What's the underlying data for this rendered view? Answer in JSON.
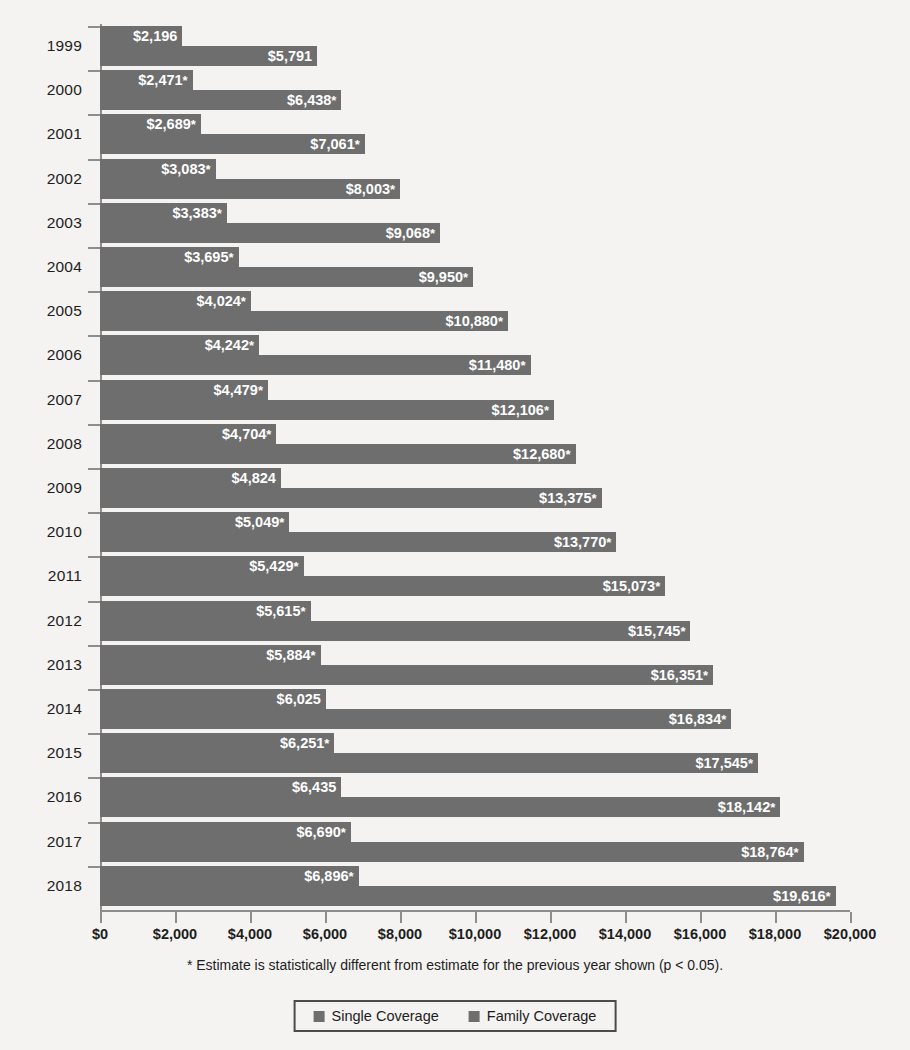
{
  "chart_data": {
    "type": "bar",
    "orientation": "horizontal",
    "title": "",
    "subtitle": "",
    "xlabel": "",
    "ylabel": "",
    "xlim": [
      0,
      20000
    ],
    "ylim": null,
    "grid": false,
    "legend_position": "bottom-center",
    "categories": [
      "1999",
      "2000",
      "2001",
      "2002",
      "2003",
      "2004",
      "2005",
      "2006",
      "2007",
      "2008",
      "2009",
      "2010",
      "2011",
      "2012",
      "2013",
      "2014",
      "2015",
      "2016",
      "2017",
      "2018"
    ],
    "x_ticks": [
      0,
      2000,
      4000,
      6000,
      8000,
      10000,
      12000,
      14000,
      16000,
      18000,
      20000
    ],
    "x_tick_labels": [
      "$0",
      "$2,000",
      "$4,000",
      "$6,000",
      "$8,000",
      "$10,000",
      "$12,000",
      "$14,000",
      "$16,000",
      "$18,000",
      "$20,000"
    ],
    "series": [
      {
        "name": "Single Coverage",
        "color": "#6e6e6e",
        "values": [
          2196,
          2471,
          2689,
          3083,
          3383,
          3695,
          4024,
          4242,
          4479,
          4704,
          4824,
          5049,
          5429,
          5615,
          5884,
          6025,
          6251,
          6435,
          6690,
          6896
        ],
        "labels": [
          "$2,196",
          "$2,471",
          "$2,689",
          "$3,083",
          "$3,383",
          "$3,695",
          "$4,024",
          "$4,242",
          "$4,479",
          "$4,704",
          "$4,824",
          "$5,049",
          "$5,429",
          "$5,615",
          "$5,884",
          "$6,025",
          "$6,251",
          "$6,435",
          "$6,690",
          "$6,896"
        ],
        "significant": [
          false,
          true,
          true,
          true,
          true,
          true,
          true,
          true,
          true,
          true,
          false,
          true,
          true,
          true,
          true,
          false,
          true,
          false,
          true,
          true
        ]
      },
      {
        "name": "Family Coverage",
        "color": "#6e6e6e",
        "values": [
          5791,
          6438,
          7061,
          8003,
          9068,
          9950,
          10880,
          11480,
          12106,
          12680,
          13375,
          13770,
          15073,
          15745,
          16351,
          16834,
          17545,
          18142,
          18764,
          19616
        ],
        "labels": [
          "$5,791",
          "$6,438",
          "$7,061",
          "$8,003",
          "$9,068",
          "$9,950",
          "$10,880",
          "$11,480",
          "$12,106",
          "$12,680",
          "$13,375",
          "$13,770",
          "$15,073",
          "$15,745",
          "$16,351",
          "$16,834",
          "$17,545",
          "$18,142",
          "$18,764",
          "$19,616"
        ],
        "significant": [
          false,
          true,
          true,
          true,
          true,
          true,
          true,
          true,
          true,
          true,
          true,
          true,
          true,
          true,
          true,
          true,
          true,
          true,
          true,
          true
        ]
      }
    ],
    "annotations": [
      "* Estimate is statistically different from estimate for the previous year shown (p < 0.05)."
    ]
  },
  "footnote": "* Estimate is statistically different from estimate for the previous year shown (p < 0.05).",
  "legend": {
    "items": [
      {
        "label": "Single Coverage",
        "color": "#6e6e6e"
      },
      {
        "label": "Family Coverage",
        "color": "#6e6e6e"
      }
    ]
  },
  "colors": {
    "bar": "#6e6e6e",
    "axis": "#8d8d8d",
    "text": "#1d1d1d",
    "bar_label_text": "#ffffff",
    "background": "#f4f3f1"
  }
}
